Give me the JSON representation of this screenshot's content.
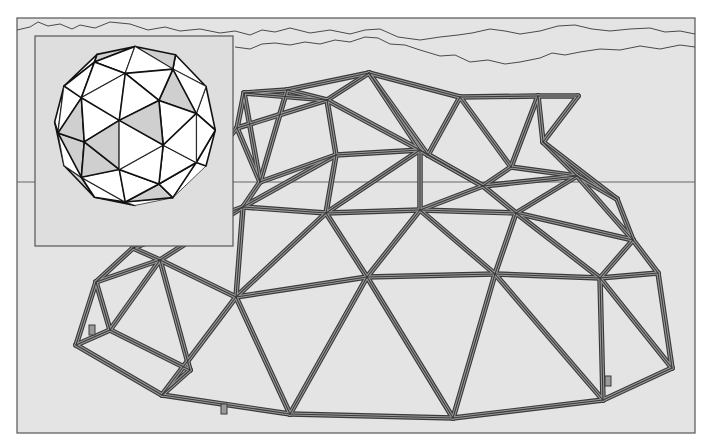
{
  "colors": {
    "page_bg": "#ffffff",
    "panel_bg": "#e4e4e4",
    "frame_stroke": "#555555",
    "cloud_stroke": "#4a4a4a",
    "horizon_stroke": "#666666",
    "strut_dark": "#3a3a3a",
    "strut_light": "#9a9a9a",
    "inset_bg": "#dedede",
    "facet_white": "#ffffff",
    "facet_shade": "#cfcfcf",
    "edge_dark": "#111111"
  },
  "frame": {
    "x": 17,
    "y": 18,
    "w": 678,
    "h": 415
  },
  "horizon_y": 182,
  "clouds": [
    "M17,30 L30,27 L38,22 L48,26 L60,24 L72,29 L80,25 L95,28 L110,22 L130,24 L148,30 L165,27 L180,31 L200,29 L220,33 L235,31 L250,35 L262,30 L275,32 L290,28 L310,33 L330,30 L350,34 L365,30 L380,29 L398,37 L420,40 L440,37 L458,35 L472,33 L490,29 L505,31 L520,34 L540,31 L558,26 L575,25 L592,29 L610,31 L630,29 L650,28 L665,32 L680,31 L695,34",
    "M235,47 L250,49 L262,44 L275,43 L290,45 L305,42 L320,44 L335,40 L350,42 L365,37 L378,38 L390,44 L405,45 L420,50 L440,56 L455,55 L470,62 L488,60 L505,64 L520,62 L540,58 L552,53 L565,55 L580,52 L600,49 L620,50 L640,46 L660,49 L680,45 L695,47"
  ],
  "inset": {
    "box": {
      "x": 35,
      "y": 36,
      "w": 198,
      "h": 210
    },
    "sphere": {
      "cx": 135,
      "cy": 126,
      "r": 82
    }
  },
  "dome": {
    "nodes": {
      "a1": [
        244,
        93
      ],
      "a2": [
        287,
        90
      ],
      "a3": [
        369,
        73
      ],
      "a4": [
        460,
        97
      ],
      "a5": [
        538,
        96
      ],
      "a6": [
        578,
        96
      ],
      "b1": [
        237,
        128
      ],
      "b2": [
        327,
        100
      ],
      "b3": [
        428,
        155
      ],
      "b4": [
        511,
        167
      ],
      "b5": [
        543,
        142
      ],
      "c1": [
        260,
        182
      ],
      "c2": [
        336,
        155
      ],
      "c3": [
        420,
        150
      ],
      "c4": [
        483,
        186
      ],
      "c5": [
        577,
        176
      ],
      "c6": [
        617,
        199
      ],
      "d1": [
        133,
        248
      ],
      "d2": [
        243,
        207
      ],
      "d3": [
        326,
        213
      ],
      "d4": [
        420,
        210
      ],
      "d5": [
        516,
        213
      ],
      "d6": [
        633,
        240
      ],
      "e1": [
        96,
        282
      ],
      "e2": [
        160,
        260
      ],
      "e3": [
        236,
        297
      ],
      "e4": [
        367,
        277
      ],
      "e5": [
        495,
        274
      ],
      "e6": [
        600,
        278
      ],
      "e7": [
        658,
        273
      ],
      "f1": [
        76,
        345
      ],
      "f2": [
        162,
        395
      ],
      "f3": [
        290,
        414
      ],
      "f4": [
        453,
        418
      ],
      "f5": [
        603,
        400
      ],
      "f6": [
        672,
        368
      ],
      "f7": [
        110,
        330
      ],
      "f8": [
        190,
        370
      ]
    },
    "struts": [
      [
        "a1",
        "a2"
      ],
      [
        "a2",
        "a3"
      ],
      [
        "a3",
        "a4"
      ],
      [
        "a4",
        "a5"
      ],
      [
        "a5",
        "a6"
      ],
      [
        "a1",
        "b2"
      ],
      [
        "a2",
        "b2"
      ],
      [
        "a3",
        "b2"
      ],
      [
        "a3",
        "b3"
      ],
      [
        "a4",
        "b3"
      ],
      [
        "a4",
        "b4"
      ],
      [
        "a5",
        "b4"
      ],
      [
        "a5",
        "b5"
      ],
      [
        "a6",
        "b5"
      ],
      [
        "a1",
        "b1"
      ],
      [
        "b1",
        "b2"
      ],
      [
        "b2",
        "c2"
      ],
      [
        "b2",
        "c3"
      ],
      [
        "b3",
        "c3"
      ],
      [
        "b3",
        "c4"
      ],
      [
        "b4",
        "c4"
      ],
      [
        "b4",
        "c5"
      ],
      [
        "b5",
        "c5"
      ],
      [
        "b5",
        "c6"
      ],
      [
        "b1",
        "c1"
      ],
      [
        "a2",
        "c1"
      ],
      [
        "c1",
        "c2"
      ],
      [
        "c2",
        "c3"
      ],
      [
        "c3",
        "c4"
      ],
      [
        "c4",
        "c5"
      ],
      [
        "c5",
        "c6"
      ],
      [
        "c1",
        "d2"
      ],
      [
        "c2",
        "d2"
      ],
      [
        "c2",
        "d3"
      ],
      [
        "c3",
        "d3"
      ],
      [
        "c3",
        "d4"
      ],
      [
        "c4",
        "d4"
      ],
      [
        "c4",
        "d5"
      ],
      [
        "c5",
        "d5"
      ],
      [
        "c5",
        "d6"
      ],
      [
        "c6",
        "d6"
      ],
      [
        "b1",
        "d1"
      ],
      [
        "d1",
        "d2"
      ],
      [
        "d2",
        "d3"
      ],
      [
        "d3",
        "d4"
      ],
      [
        "d4",
        "d5"
      ],
      [
        "d5",
        "d6"
      ],
      [
        "d1",
        "e2"
      ],
      [
        "d2",
        "e2"
      ],
      [
        "d2",
        "e3"
      ],
      [
        "d3",
        "e3"
      ],
      [
        "d3",
        "e4"
      ],
      [
        "d4",
        "e4"
      ],
      [
        "d4",
        "e5"
      ],
      [
        "d5",
        "e5"
      ],
      [
        "d5",
        "e6"
      ],
      [
        "d6",
        "e6"
      ],
      [
        "d6",
        "e7"
      ],
      [
        "d1",
        "e1"
      ],
      [
        "e1",
        "e2"
      ],
      [
        "e2",
        "e3"
      ],
      [
        "e3",
        "e4"
      ],
      [
        "e4",
        "e5"
      ],
      [
        "e5",
        "e6"
      ],
      [
        "e6",
        "e7"
      ],
      [
        "e1",
        "f1"
      ],
      [
        "e1",
        "f7"
      ],
      [
        "e2",
        "f7"
      ],
      [
        "e2",
        "f8"
      ],
      [
        "e3",
        "f2"
      ],
      [
        "e3",
        "f3"
      ],
      [
        "e4",
        "f3"
      ],
      [
        "e4",
        "f4"
      ],
      [
        "e5",
        "f4"
      ],
      [
        "e5",
        "f5"
      ],
      [
        "e6",
        "f5"
      ],
      [
        "e6",
        "f6"
      ],
      [
        "e7",
        "f6"
      ],
      [
        "f1",
        "f2"
      ],
      [
        "f2",
        "f3"
      ],
      [
        "f3",
        "f4"
      ],
      [
        "f4",
        "f5"
      ],
      [
        "f5",
        "f6"
      ],
      [
        "f7",
        "f8"
      ],
      [
        "f1",
        "f7"
      ],
      [
        "f8",
        "f2"
      ],
      [
        "c3",
        "a3"
      ],
      [
        "a1",
        "c1"
      ]
    ],
    "connectors": [
      [
        224,
        409
      ],
      [
        608,
        381
      ],
      [
        92,
        330
      ]
    ]
  }
}
